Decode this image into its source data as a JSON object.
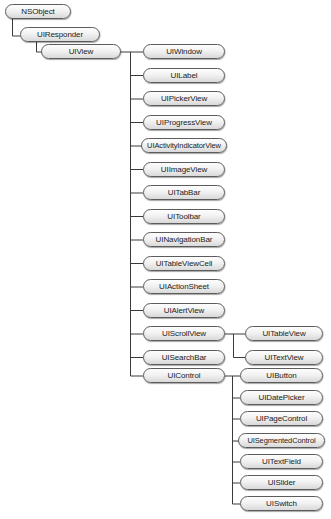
{
  "diagram": {
    "nodes": {
      "nsobject": "NSObject",
      "uiresponder": "UIResponder",
      "uiview": "UIView",
      "uiwindow": "UIWindow",
      "uilabel": "UILabel",
      "uipickerview": "UIPickerView",
      "uiprogressview": "UIProgressView",
      "uiactivityindicatorview": "UIActivityIndicatorView",
      "uiimageview": "UIImageView",
      "uitabbar": "UITabBar",
      "uitoolbar": "UIToolbar",
      "uinavigationbar": "UINavigationBar",
      "uitableviewcell": "UITableViewCell",
      "uiactionsheet": "UIActionSheet",
      "uialertview": "UIAlertView",
      "uiscrollview": "UIScrollView",
      "uisearchbar": "UISearchBar",
      "uiwebview": "UIWebView",
      "uicontrol": "UIControl",
      "uitableview": "UITableView",
      "uitextview": "UITextView",
      "uibutton": "UIButton",
      "uidatepicker": "UIDatePicker",
      "uipagecontrol": "UIPageControl",
      "uisegmentedcontrol": "UISegmentedControl",
      "uitextfield": "UITextField",
      "uislider": "UISlider",
      "uiswitch": "UISwitch"
    },
    "edges": [
      [
        "NSObject",
        "UIResponder"
      ],
      [
        "UIResponder",
        "UIView"
      ],
      [
        "UIView",
        "UIWindow"
      ],
      [
        "UIView",
        "UILabel"
      ],
      [
        "UIView",
        "UIPickerView"
      ],
      [
        "UIView",
        "UIProgressView"
      ],
      [
        "UIView",
        "UIActivityIndicatorView"
      ],
      [
        "UIView",
        "UIImageView"
      ],
      [
        "UIView",
        "UITabBar"
      ],
      [
        "UIView",
        "UIToolbar"
      ],
      [
        "UIView",
        "UINavigationBar"
      ],
      [
        "UIView",
        "UITableViewCell"
      ],
      [
        "UIView",
        "UIActionSheet"
      ],
      [
        "UIView",
        "UIAlertView"
      ],
      [
        "UIView",
        "UIScrollView"
      ],
      [
        "UIView",
        "UISearchBar"
      ],
      [
        "UIView",
        "UIWebView"
      ],
      [
        "UIView",
        "UIControl"
      ],
      [
        "UIScrollView",
        "UITableView"
      ],
      [
        "UIScrollView",
        "UITextView"
      ],
      [
        "UIControl",
        "UIButton"
      ],
      [
        "UIControl",
        "UIDatePicker"
      ],
      [
        "UIControl",
        "UIPageControl"
      ],
      [
        "UIControl",
        "UISegmentedControl"
      ],
      [
        "UIControl",
        "UITextField"
      ],
      [
        "UIControl",
        "UISlider"
      ],
      [
        "UIControl",
        "UISwitch"
      ]
    ],
    "colors": {
      "line": "#3a3a3a",
      "node_border": "#5c5c5c",
      "node_fill_top": "#fdfdfd",
      "node_fill_bottom": "#d9d9d9",
      "text": "#1c1c1c"
    }
  }
}
